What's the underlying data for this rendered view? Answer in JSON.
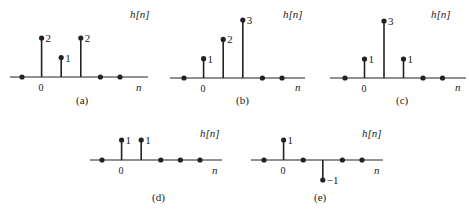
{
  "chart_data": [
    {
      "type": "stem",
      "id": "a",
      "caption": "(a)",
      "ylabel": "h[n]",
      "xlabel": "n",
      "zero_label": "0",
      "n": [
        -1,
        0,
        1,
        2,
        3,
        4
      ],
      "values": [
        0,
        2,
        1,
        2,
        0,
        0
      ],
      "value_labels": [
        "",
        "2",
        "1",
        "2",
        "",
        ""
      ]
    },
    {
      "type": "stem",
      "id": "b",
      "caption": "(b)",
      "ylabel": "h[n]",
      "xlabel": "n",
      "zero_label": "0",
      "n": [
        -1,
        0,
        1,
        2,
        3,
        4
      ],
      "values": [
        0,
        1,
        2,
        3,
        0,
        0
      ],
      "value_labels": [
        "",
        "1",
        "2",
        "3",
        "",
        ""
      ]
    },
    {
      "type": "stem",
      "id": "c",
      "caption": "(c)",
      "ylabel": "h[n]",
      "xlabel": "n",
      "zero_label": "0",
      "n": [
        -1,
        0,
        1,
        2,
        3,
        4
      ],
      "values": [
        0,
        1,
        3,
        1,
        0,
        0
      ],
      "value_labels": [
        "",
        "1",
        "3",
        "1",
        "",
        ""
      ]
    },
    {
      "type": "stem",
      "id": "d",
      "caption": "(d)",
      "ylabel": "h[n]",
      "xlabel": "n",
      "zero_label": "0",
      "n": [
        -1,
        0,
        1,
        2,
        3,
        4
      ],
      "values": [
        0,
        1,
        1,
        0,
        0,
        0
      ],
      "value_labels": [
        "",
        "1",
        "1",
        "",
        "",
        ""
      ]
    },
    {
      "type": "stem",
      "id": "e",
      "caption": "(e)",
      "ylabel": "h[n]",
      "xlabel": "n",
      "zero_label": "0",
      "n": [
        -1,
        0,
        1,
        2,
        3,
        4
      ],
      "values": [
        0,
        1,
        0,
        -1,
        0,
        0
      ],
      "value_labels": [
        "",
        "1",
        "",
        "−1",
        "",
        ""
      ]
    }
  ],
  "layout": [
    {
      "x0": 22,
      "dx": 19.6,
      "axis_y": 77,
      "unit": 19.5,
      "axis_left": 10,
      "axis_right": 148,
      "hn_x": 130,
      "hn_y": 18,
      "nl_x": 136,
      "nl_y": 91,
      "cap_x": 76,
      "cap_y": 104
    },
    {
      "x0": 184,
      "dx": 19.6,
      "axis_y": 78,
      "unit": 19.3,
      "axis_left": 170,
      "axis_right": 305,
      "hn_x": 283,
      "hn_y": 18,
      "nl_x": 295,
      "nl_y": 91,
      "cap_x": 236,
      "cap_y": 104
    },
    {
      "x0": 345,
      "dx": 19.5,
      "axis_y": 78,
      "unit": 19.0,
      "axis_left": 330,
      "axis_right": 466,
      "hn_x": 431,
      "hn_y": 18,
      "nl_x": 455,
      "nl_y": 91,
      "cap_x": 396,
      "cap_y": 104
    },
    {
      "x0": 102,
      "dx": 19.6,
      "axis_y": 160,
      "unit": 20,
      "axis_left": 90,
      "axis_right": 222,
      "hn_x": 200,
      "hn_y": 137,
      "nl_x": 212,
      "nl_y": 174,
      "cap_x": 152,
      "cap_y": 201
    },
    {
      "x0": 264,
      "dx": 19.6,
      "axis_y": 160,
      "unit": 20,
      "axis_left": 251,
      "axis_right": 383,
      "hn_x": 362,
      "hn_y": 137,
      "nl_x": 374,
      "nl_y": 174,
      "cap_x": 314,
      "cap_y": 201
    }
  ],
  "colors": {
    "ink": "#222222",
    "background": "#ffffff"
  }
}
